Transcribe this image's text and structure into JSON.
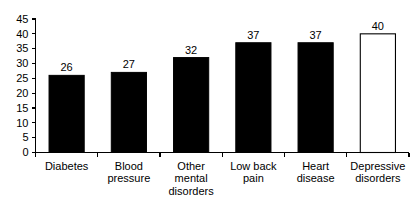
{
  "chart_data": {
    "type": "bar",
    "title": "",
    "subtitle": "",
    "xlabel": "",
    "ylabel": "",
    "ylim": [
      0,
      45
    ],
    "ytick_values": [
      0,
      5,
      10,
      15,
      20,
      25,
      30,
      35,
      40,
      45
    ],
    "ytick_labels": [
      "0",
      "5",
      "10",
      "15",
      "20",
      "25",
      "30",
      "35",
      "40",
      "45"
    ],
    "grid": false,
    "legend": null,
    "categories": [
      "Diabetes",
      "Blood pressure",
      "Other mental disorders",
      "Low back pain",
      "Heart disease",
      "Depressive disorders"
    ],
    "category_label_lines": [
      [
        "Diabetes"
      ],
      [
        "Blood",
        "pressure"
      ],
      [
        "Other",
        "mental",
        "disorders"
      ],
      [
        "Low back",
        "pain"
      ],
      [
        "Heart",
        "disease"
      ],
      [
        "Depressive",
        "disorders"
      ]
    ],
    "values": [
      26,
      27,
      32,
      37,
      37,
      40
    ],
    "value_labels": [
      "26",
      "27",
      "32",
      "37",
      "37",
      "40"
    ],
    "bar_styles": [
      "filled",
      "filled",
      "filled",
      "filled",
      "filled",
      "open"
    ],
    "colors": {
      "bar_fill": "#000000",
      "bar_open_fill": "#ffffff",
      "bar_stroke": "#000000",
      "axis": "#000000",
      "text": "#000000",
      "background": "#ffffff"
    }
  }
}
